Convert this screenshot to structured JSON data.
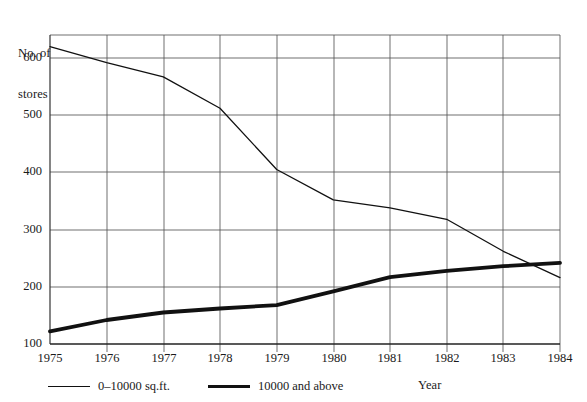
{
  "chart_data": {
    "type": "line",
    "title": "",
    "xlabel": "Year",
    "ylabel": "No. of\nstores",
    "ylabel_line1": "No. of",
    "ylabel_line2": "stores",
    "categories": [
      "1975",
      "1976",
      "1977",
      "1978",
      "1979",
      "1980",
      "1981",
      "1982",
      "1983",
      "1984"
    ],
    "x": [
      1975,
      1976,
      1977,
      1978,
      1979,
      1980,
      1981,
      1982,
      1983,
      1984
    ],
    "xlim": [
      1975,
      1984
    ],
    "ylim": [
      100,
      654
    ],
    "yticks": [
      "100",
      "200",
      "300",
      "400",
      "500",
      "600"
    ],
    "ytick_values": [
      100,
      200,
      300,
      400,
      500,
      600
    ],
    "grid": "both",
    "legend_position": "below-axis-left",
    "series": [
      {
        "name": "0–10000 sq.ft.",
        "style": "thin",
        "color": "#111111",
        "values": [
          620,
          592,
          567,
          512,
          405,
          352,
          338,
          318,
          262,
          216
        ]
      },
      {
        "name": "10000 and above",
        "style": "thick",
        "color": "#111111",
        "values": [
          122,
          142,
          155,
          162,
          168,
          192,
          217,
          228,
          236,
          242
        ]
      }
    ]
  },
  "legend": {
    "items": [
      {
        "label": "0–10000 sq.ft.",
        "swatch": "thin-line-swatch"
      },
      {
        "label": "10000 and above",
        "swatch": "thick-line-swatch"
      }
    ]
  },
  "page": {
    "cropped_header_text": ""
  }
}
